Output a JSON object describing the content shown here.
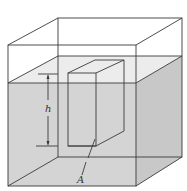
{
  "figure": {
    "labels": {
      "height": "h",
      "area": "A"
    },
    "colors": {
      "background": "#ffffff",
      "liquid_front": "#d4d4d4",
      "liquid_top": "#ececec",
      "liquid_side": "#c8c8c8",
      "line": "#3a3a3a"
    }
  }
}
